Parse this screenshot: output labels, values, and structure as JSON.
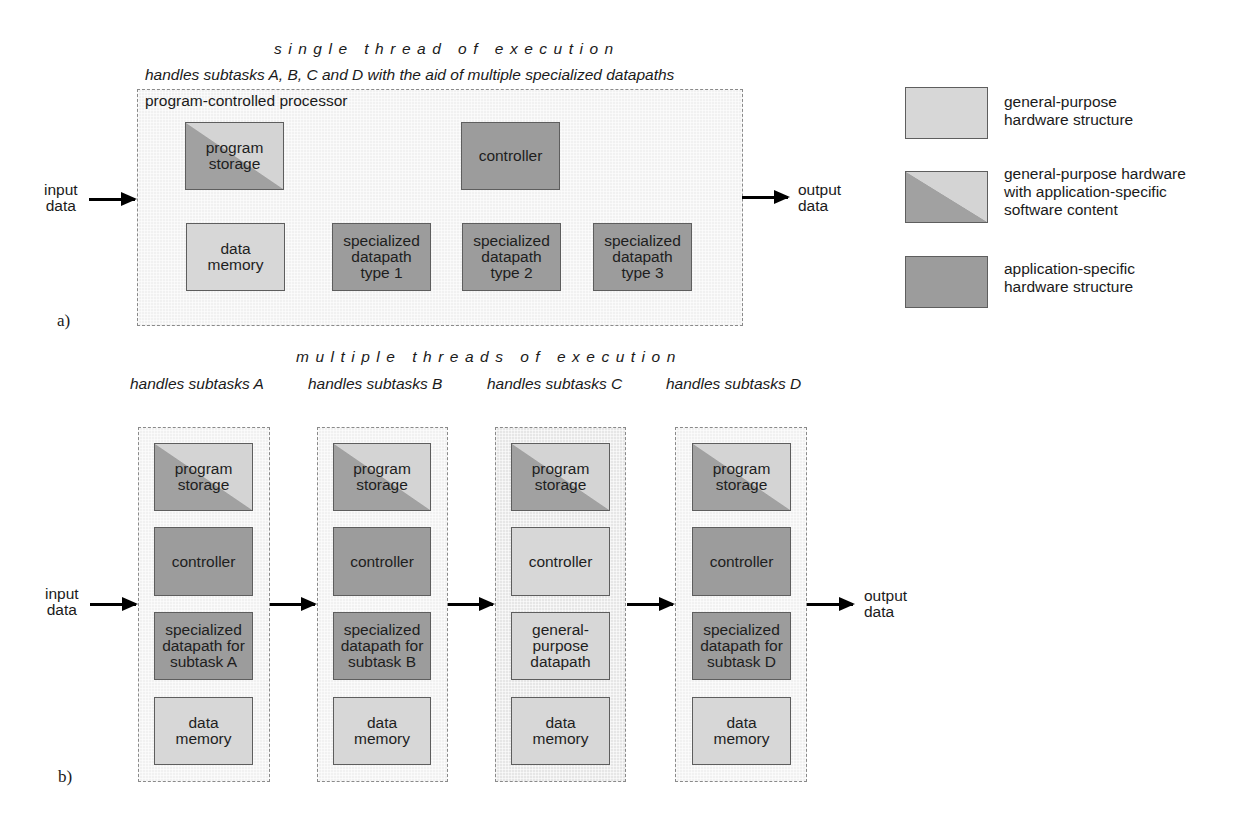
{
  "part_a": {
    "tag": "a)",
    "title": "single thread of execution",
    "subtitle": "handles subtasks A, B, C and D with the aid of multiple specialized datapaths",
    "container_label": "program-controlled processor",
    "input_label": "input\ndata",
    "output_label": "output\ndata",
    "blocks": {
      "program_storage": "program\nstorage",
      "controller": "controller",
      "data_memory": "data\nmemory",
      "datapath_1": "specialized\ndatapath\ntype 1",
      "datapath_2": "specialized\ndatapath\ntype 2",
      "datapath_3": "specialized\ndatapath\ntype 3"
    }
  },
  "legend": {
    "items": [
      {
        "kind": "general-purpose",
        "label": "general-purpose\nhardware structure"
      },
      {
        "kind": "mixed",
        "label": "general-purpose hardware\nwith application-specific\nsoftware content"
      },
      {
        "kind": "application-specific",
        "label": "application-specific\nhardware structure"
      }
    ]
  },
  "part_b": {
    "tag": "b)",
    "title": "multiple threads of execution",
    "input_label": "input\ndata",
    "output_label": "output\ndata",
    "columns": [
      {
        "title": "handles subtasks A",
        "program_storage": "program\nstorage",
        "controller": "controller",
        "datapath": "specialized\ndatapath for\nsubtask A",
        "data_memory": "data\nmemory"
      },
      {
        "title": "handles subtasks B",
        "program_storage": "program\nstorage",
        "controller": "controller",
        "datapath": "specialized\ndatapath for\nsubtask B",
        "data_memory": "data\nmemory"
      },
      {
        "title": "handles subtasks C",
        "program_storage": "program\nstorage",
        "controller": "controller",
        "datapath": "general-\npurpose\ndatapath",
        "data_memory": "data\nmemory"
      },
      {
        "title": "handles subtasks D",
        "program_storage": "program\nstorage",
        "controller": "controller",
        "datapath": "specialized\ndatapath for\nsubtask D",
        "data_memory": "data\nmemory"
      }
    ]
  },
  "colors": {
    "general_purpose": "#d7d7d7",
    "application_specific": "#9c9c9c",
    "container_bg": "#f1f1f1",
    "border": "#5e5e5e"
  }
}
